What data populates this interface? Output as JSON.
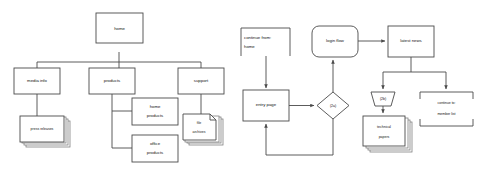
{
  "meta": {
    "background_color": "#ffffff",
    "stroke_color": "#4a4a4a",
    "text_color": "#111111"
  },
  "left_diagram": {
    "name": "site-hierarchy-tree",
    "nodes": {
      "home": "home",
      "media_info": "media info",
      "products": "products",
      "support": "support",
      "press_releases": "press releases",
      "home_products_line1": "home",
      "home_products_line2": "products",
      "office_products_line1": "office",
      "office_products_line2": "products",
      "file_archives_line1": "file",
      "file_archives_line2": "archives"
    }
  },
  "right_diagram": {
    "name": "login-flow-chart",
    "nodes": {
      "continue_from_line1": "continue from:",
      "continue_from_line2": "home",
      "login_flow": "login flow",
      "latest_news": "latest news",
      "entry_page": "entry page",
      "decision": "(2a)",
      "gate": "(2b)",
      "technical_papers_line1": "technical",
      "technical_papers_line2": "papers",
      "continue_to_line1": "continue to:",
      "continue_to_line2": "member list"
    }
  }
}
